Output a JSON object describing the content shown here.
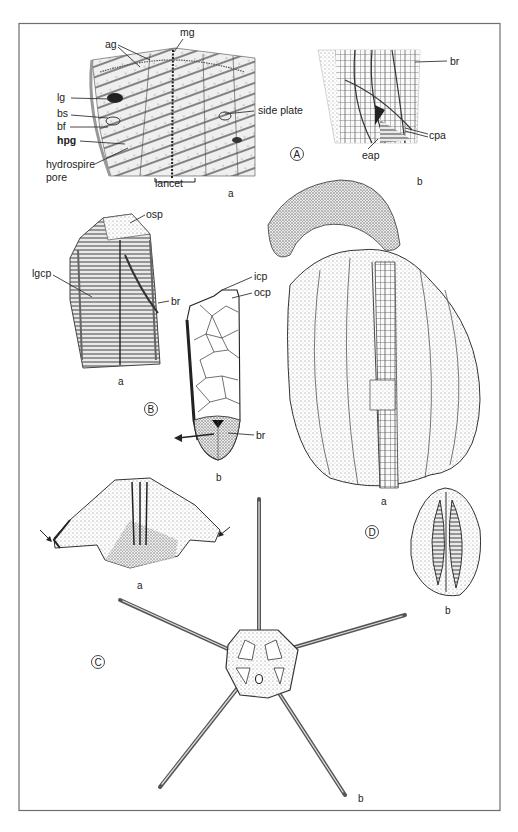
{
  "plate": {
    "frame_color": "#6e6e6e",
    "ink_color": "#2a2a2a",
    "stipple_color": "#9a9a9a"
  },
  "groups": {
    "A": {
      "marker": "A",
      "a": {
        "sublabel": "a",
        "labels": {
          "ag": "ag",
          "mg": "mg",
          "lg": "lg",
          "bs": "bs",
          "bf": "bf",
          "hpg": "hpg",
          "hydrospire_1": "hydrospire",
          "hydrospire_2": "pore",
          "side_plate": "side plate",
          "lancet": "lancet"
        }
      },
      "b": {
        "sublabel": "b",
        "labels": {
          "br": "br",
          "cpa": "cpa",
          "eap": "eap"
        }
      }
    },
    "B": {
      "marker": "B",
      "a": {
        "sublabel": "a",
        "labels": {
          "osp": "osp",
          "lgcp": "lgcp",
          "br": "br"
        }
      },
      "b": {
        "sublabel": "b",
        "labels": {
          "icp": "icp",
          "ocp": "ocp",
          "br": "br"
        }
      }
    },
    "C": {
      "marker": "C",
      "a": {
        "sublabel": "a"
      },
      "b": {
        "sublabel": "b"
      }
    },
    "D": {
      "marker": "D",
      "a": {
        "sublabel": "a"
      },
      "b": {
        "sublabel": "b"
      }
    }
  }
}
